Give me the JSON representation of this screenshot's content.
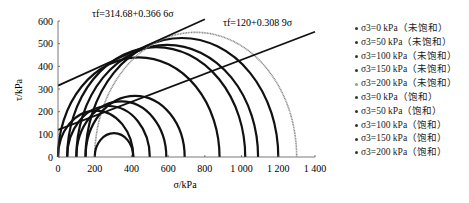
{
  "chart_data": {
    "type": "scatter",
    "title": "",
    "xlabel": "σ/kPa",
    "ylabel": "τ/kPa",
    "xlim": [
      0,
      1400
    ],
    "ylim": [
      0,
      600
    ],
    "xticks": [
      "0",
      "200",
      "400",
      "600",
      "800",
      "1 000",
      "1 200",
      "1 400"
    ],
    "yticks": [
      "0",
      "100",
      "200",
      "300",
      "400",
      "500",
      "600"
    ],
    "grid": false,
    "legend_position": "right",
    "annotations": [
      {
        "text": "τf=314.68+0.366 6σ",
        "intercept": 314.68,
        "slope": 0.3666,
        "x_end": 800
      },
      {
        "text": "τf=120+0.308 9σ",
        "intercept": 120,
        "slope": 0.3089,
        "x_end": 1400
      }
    ],
    "series": [
      {
        "name": "σ3=0 kPa（未饱和）",
        "sigma3": 0,
        "sigma1": 880,
        "style": "dark"
      },
      {
        "name": "σ3=50 kPa（未饱和）",
        "sigma3": 50,
        "sigma1": 1020,
        "style": "dark"
      },
      {
        "name": "σ3=100 kPa（未饱和）",
        "sigma3": 100,
        "sigma1": 1090,
        "style": "dark"
      },
      {
        "name": "σ3=150 kPa（未饱和）",
        "sigma3": 150,
        "sigma1": 1200,
        "style": "dark"
      },
      {
        "name": "σ3=200 kPa（未饱和）",
        "sigma3": 200,
        "sigma1": 1300,
        "style": "light"
      },
      {
        "name": "σ3=0 kPa（饱和）",
        "sigma3": 0,
        "sigma1": 410,
        "style": "dark"
      },
      {
        "name": "σ3=50 kPa（饱和）",
        "sigma3": 50,
        "sigma1": 500,
        "style": "dark"
      },
      {
        "name": "σ3=100 kPa（饱和）",
        "sigma3": 100,
        "sigma1": 590,
        "style": "dark"
      },
      {
        "name": "σ3=150 kPa（饱和）",
        "sigma3": 150,
        "sigma1": 690,
        "style": "dark"
      },
      {
        "name": "σ3=200 kPa（饱和）",
        "sigma3": 200,
        "sigma1": 410,
        "style": "dark"
      }
    ]
  },
  "legend": [
    "σ3=0 kPa（未饱和）",
    "σ3=50 kPa（未饱和）",
    "σ3=100 kPa（未饱和）",
    "σ3=150 kPa（未饱和）",
    "σ3=200 kPa（未饱和）",
    "σ3=0 kPa（饱和）",
    "σ3=50 kPa（饱和）",
    "σ3=100 kPa（饱和）",
    "σ3=150 kPa（饱和）",
    "σ3=200 kPa（饱和）"
  ]
}
